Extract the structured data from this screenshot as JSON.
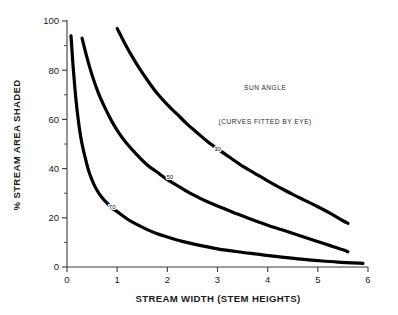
{
  "chart_data": {
    "type": "line",
    "title": "",
    "xlabel": "STREAM WIDTH (STEM HEIGHTS)",
    "ylabel": "% STREAM AREA SHADED",
    "xlim": [
      0,
      6
    ],
    "ylim": [
      0,
      100
    ],
    "xticks": [
      "0",
      "1",
      "2",
      "3",
      "4",
      "5",
      "6"
    ],
    "yticks": [
      "0",
      "20",
      "40",
      "60",
      "80",
      "100"
    ],
    "xtick_values": [
      0,
      1,
      2,
      3,
      4,
      5,
      6
    ],
    "ytick_values": [
      0,
      20,
      40,
      60,
      80,
      100
    ],
    "minor_ytick_values": [
      10,
      30,
      50,
      70,
      90
    ],
    "grid": false,
    "legend_position": "inline-curve-labels",
    "annotations": [
      {
        "name": "sun-angle-note",
        "text": "SUN ANGLE",
        "x": 3.95,
        "y": 72
      },
      {
        "name": "curves-fitted-note",
        "text": "(CURVES FITTED BY EYE)",
        "x": 3.95,
        "y": 58
      }
    ],
    "series": [
      {
        "name": "70",
        "label": "70",
        "label_x": 0.9,
        "label_y": 24.5,
        "color": "#000000",
        "points": [
          [
            0.08,
            94
          ],
          [
            0.12,
            82
          ],
          [
            0.16,
            72
          ],
          [
            0.2,
            64
          ],
          [
            0.25,
            56
          ],
          [
            0.3,
            50
          ],
          [
            0.38,
            43
          ],
          [
            0.45,
            38
          ],
          [
            0.55,
            33
          ],
          [
            0.65,
            29.5
          ],
          [
            0.75,
            27
          ],
          [
            0.9,
            24
          ],
          [
            1.0,
            22.5
          ],
          [
            1.2,
            19.5
          ],
          [
            1.4,
            17.2
          ],
          [
            1.6,
            15.2
          ],
          [
            1.8,
            13.5
          ],
          [
            2.0,
            12.2
          ],
          [
            2.3,
            10.4
          ],
          [
            2.6,
            9.0
          ],
          [
            3.0,
            7.4
          ],
          [
            3.4,
            6.2
          ],
          [
            3.8,
            5.2
          ],
          [
            4.2,
            4.2
          ],
          [
            4.6,
            3.3
          ],
          [
            5.0,
            2.6
          ],
          [
            5.4,
            2.0
          ],
          [
            5.9,
            1.5
          ]
        ]
      },
      {
        "name": "50",
        "label": "50",
        "label_x": 2.05,
        "label_y": 36.5,
        "color": "#000000",
        "points": [
          [
            0.3,
            93
          ],
          [
            0.4,
            85
          ],
          [
            0.5,
            78
          ],
          [
            0.62,
            71
          ],
          [
            0.75,
            65
          ],
          [
            0.9,
            59
          ],
          [
            1.05,
            54
          ],
          [
            1.2,
            50
          ],
          [
            1.4,
            45.5
          ],
          [
            1.6,
            41.5
          ],
          [
            1.8,
            38.5
          ],
          [
            2.0,
            35.5
          ],
          [
            2.25,
            32.5
          ],
          [
            2.5,
            29.5
          ],
          [
            2.8,
            26.5
          ],
          [
            3.1,
            24
          ],
          [
            3.4,
            21.5
          ],
          [
            3.7,
            19.2
          ],
          [
            4.0,
            17
          ],
          [
            4.3,
            15
          ],
          [
            4.6,
            13
          ],
          [
            4.9,
            11
          ],
          [
            5.2,
            9
          ],
          [
            5.5,
            7
          ],
          [
            5.6,
            6.2
          ]
        ]
      },
      {
        "name": "30",
        "label": "30",
        "label_x": 3.0,
        "label_y": 48,
        "color": "#000000",
        "points": [
          [
            1.0,
            97
          ],
          [
            1.15,
            91
          ],
          [
            1.3,
            85.5
          ],
          [
            1.45,
            80.5
          ],
          [
            1.6,
            76
          ],
          [
            1.8,
            70.5
          ],
          [
            2.0,
            66
          ],
          [
            2.2,
            62
          ],
          [
            2.4,
            58
          ],
          [
            2.6,
            54.5
          ],
          [
            2.8,
            51
          ],
          [
            3.0,
            48
          ],
          [
            3.25,
            44.5
          ],
          [
            3.5,
            41
          ],
          [
            3.75,
            38
          ],
          [
            4.0,
            35
          ],
          [
            4.25,
            32.2
          ],
          [
            4.5,
            29.5
          ],
          [
            4.75,
            27
          ],
          [
            5.0,
            24.5
          ],
          [
            5.25,
            21.8
          ],
          [
            5.5,
            18.8
          ],
          [
            5.6,
            17.8
          ]
        ]
      }
    ]
  }
}
